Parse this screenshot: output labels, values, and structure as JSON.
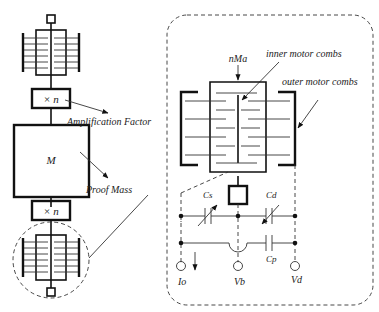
{
  "left_column": {
    "amplifier_top_label": "× n",
    "mass_label": "M",
    "amplifier_bottom_label": "× n",
    "amplification_annotation": "Amplification Factor",
    "proof_mass_annotation": "Proof Mass"
  },
  "detail_view": {
    "top_label": "nMa",
    "inner_combs_annotation": "inner motor combs",
    "outer_combs_annotation": "outer motor combs",
    "capacitor_sense_label": "Cs",
    "capacitor_drive_label": "Cd",
    "capacitor_parasitic_label": "Cp",
    "terminal_current_label": "Io",
    "terminal_bias_label": "Vb",
    "terminal_drive_label": "Vd"
  }
}
